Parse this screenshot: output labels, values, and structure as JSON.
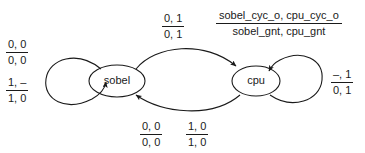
{
  "diagram": {
    "type": "state-transition-diagram",
    "stroke_color": "#1a1a1a",
    "text_color": "#1a1a1a",
    "background_color": "#ffffff",
    "states": [
      {
        "id": "sobel",
        "label": "sobel"
      },
      {
        "id": "cpu",
        "label": "cpu"
      }
    ],
    "legend": {
      "numerator": "sobel_cyc_o, cpu_cyc_o",
      "denominator": "sobel_gnt, cpu_gnt"
    },
    "transitions": [
      {
        "id": "sobel-self-loop-top",
        "from": "sobel",
        "to": "sobel",
        "numerator": "0, 0",
        "denominator": "0, 0"
      },
      {
        "id": "sobel-self-loop-bottom",
        "from": "sobel",
        "to": "sobel",
        "numerator": "1, –",
        "denominator": "1, 0"
      },
      {
        "id": "sobel-to-cpu",
        "from": "sobel",
        "to": "cpu",
        "numerator": "0, 1",
        "denominator": "0, 1"
      },
      {
        "id": "cpu-to-sobel-left",
        "from": "cpu",
        "to": "sobel",
        "numerator": "0, 0",
        "denominator": "0, 0"
      },
      {
        "id": "cpu-to-sobel-right",
        "from": "cpu",
        "to": "sobel",
        "numerator": "1, 0",
        "denominator": "1, 0"
      },
      {
        "id": "cpu-self-loop",
        "from": "cpu",
        "to": "cpu",
        "numerator": "–, 1",
        "denominator": "0, 1"
      }
    ]
  }
}
